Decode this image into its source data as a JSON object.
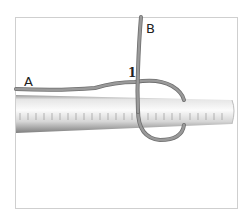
{
  "diagram": {
    "labels": {
      "end_a": "A",
      "end_b": "B",
      "step": "1"
    },
    "colors": {
      "rope": "#8c8c8c",
      "rope_edge": "#6f6f6f",
      "rod_light": "#f2f2f2",
      "rod_dark": "#8f8f8f",
      "frame": "#cfcfcf"
    }
  }
}
